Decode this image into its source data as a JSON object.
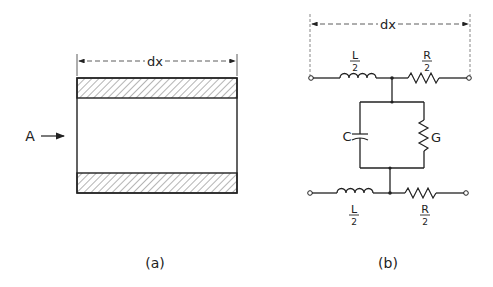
{
  "figure_a": {
    "caption": "(a)",
    "dimension_label": "dx",
    "arrow_label": "A"
  },
  "figure_b": {
    "caption": "(b)",
    "dimension_label": "dx",
    "top_inductor": {
      "num": "L",
      "den": "2"
    },
    "top_resistor": {
      "num": "R",
      "den": "2"
    },
    "bottom_inductor": {
      "num": "L",
      "den": "2"
    },
    "bottom_resistor": {
      "num": "R",
      "den": "2"
    },
    "capacitor_label": "C",
    "conductance_label": "G"
  },
  "colors": {
    "ink": "#222222",
    "background": "#ffffff"
  }
}
